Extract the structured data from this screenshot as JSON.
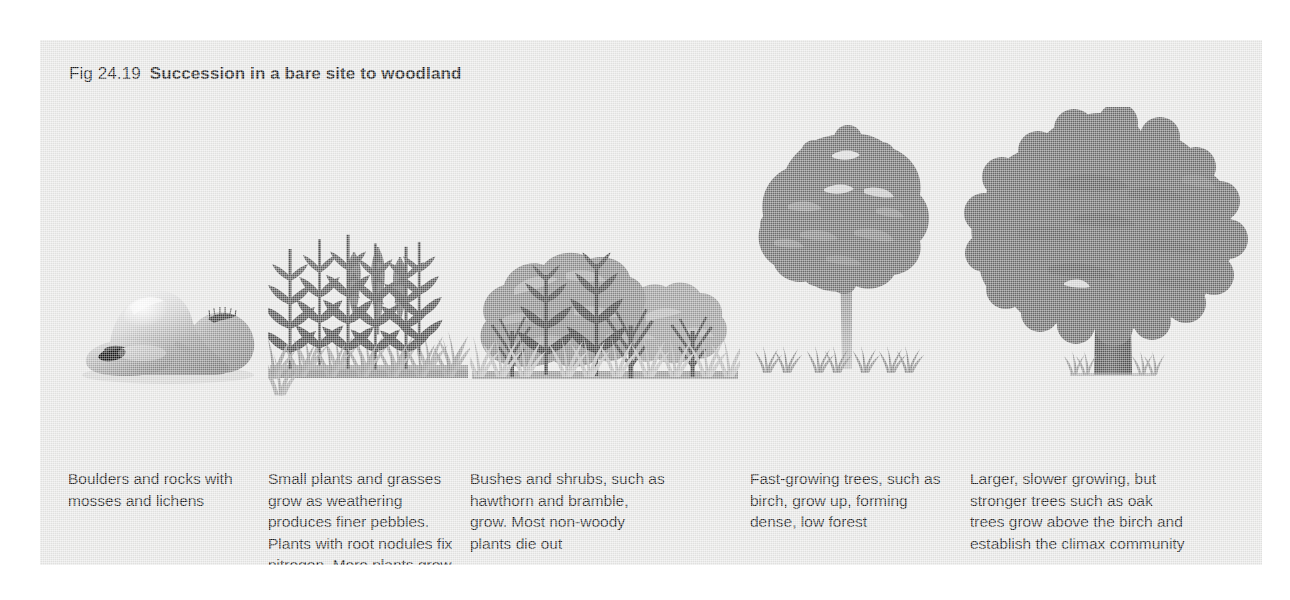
{
  "figure": {
    "number": "Fig 24.19",
    "title": "Succession in a bare site to woodland",
    "background_color": "#e9e9e8",
    "page_color": "#ffffff"
  },
  "palette": {
    "dark_vegetation": "#595959",
    "mid_vegetation": "#777777",
    "light_vegetation": "#9a9a9a",
    "pale_vegetation": "#b5b5b5",
    "trunk_light": "#9d9d9d",
    "trunk_dark": "#5f5f5f",
    "rock_light": "#d8d8d8",
    "rock_mid": "#a8a8a8",
    "rock_dark": "#6e6e6e",
    "moss_dark": "#202020",
    "text": "#1d1d1d"
  },
  "stages": [
    {
      "id": "stage-1",
      "name": "boulders-and-rocks",
      "art": "boulders-with-moss-and-lichens",
      "caption": "Boulders and rocks with mosses and lichens"
    },
    {
      "id": "stage-2",
      "name": "small-plants-and-grasses",
      "art": "tall-herbaceous-plants-and-grass",
      "caption": "Small plants and grasses grow as weathering produces finer pebbles. Plants with root nodules fix nitrogen. More plants grow as soil develops"
    },
    {
      "id": "stage-3",
      "name": "bushes-and-shrubs",
      "art": "shrub-thicket-hawthorn-and-bramble",
      "caption": "Bushes and shrubs, such as hawthorn and bramble, grow. Most non-woody plants die out"
    },
    {
      "id": "stage-4",
      "name": "fast-growing-trees",
      "art": "birch-tree-with-grass-tufts",
      "caption": "Fast-growing trees, such as birch, grow up, forming dense, low forest"
    },
    {
      "id": "stage-5",
      "name": "climax-woodland",
      "art": "mature-oak-tree",
      "caption": "Larger, slower growing, but stronger trees such as oak trees grow above the birch and establish the climax community"
    }
  ]
}
